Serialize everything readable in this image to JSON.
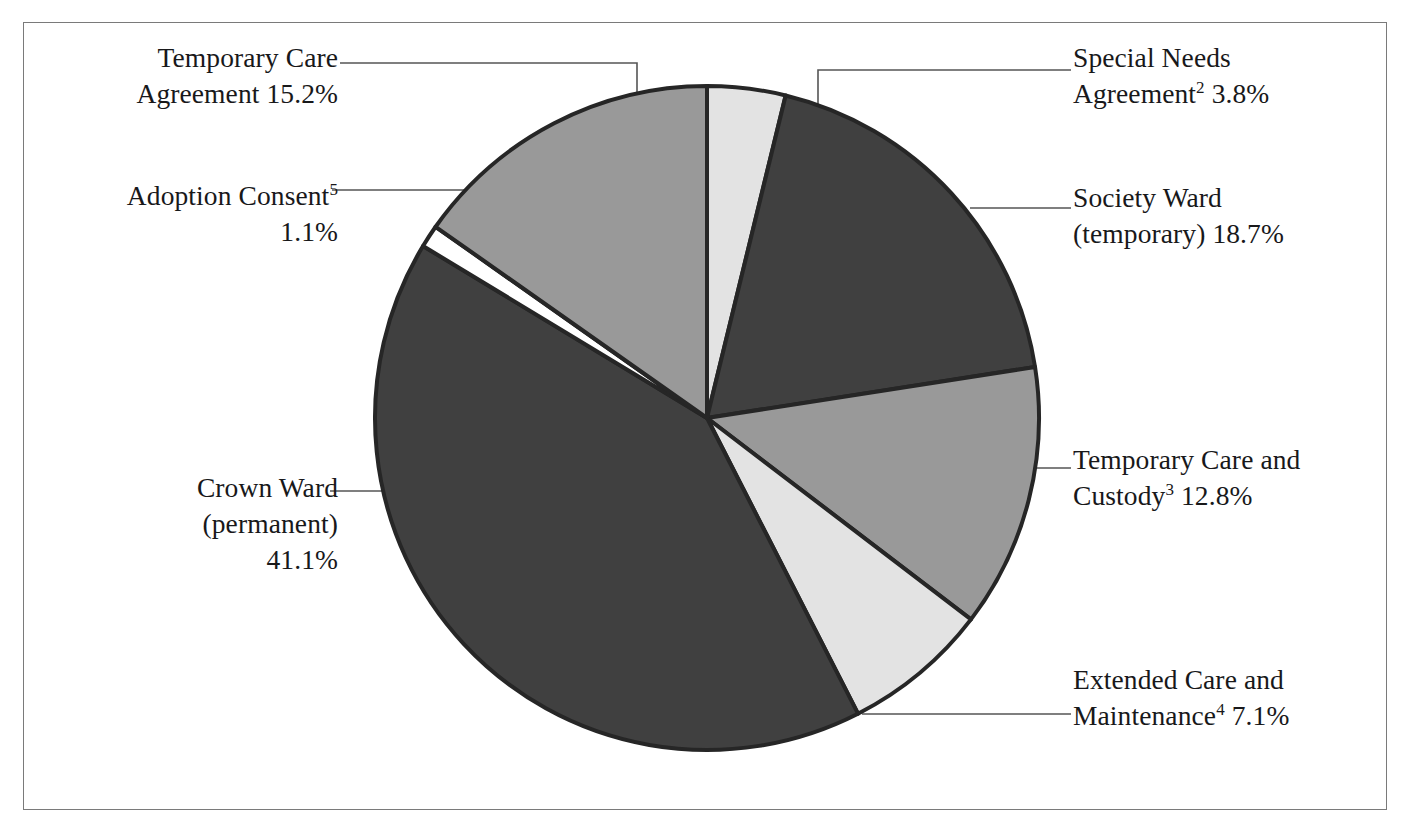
{
  "chart_data": {
    "type": "pie",
    "title": "",
    "subtitle": "",
    "xlabel": "",
    "ylabel": "",
    "legend_position": "callout-labels",
    "grid": false,
    "units": "percent",
    "total": 99.8,
    "start_angle_deg": 0,
    "direction": "clockwise",
    "categories": [
      "Special Needs Agreement2",
      "Society Ward (temporary)",
      "Temporary Care and Custody3",
      "Extended Care and Maintenance4",
      "Crown Ward (permanent)",
      "Adoption Consent5",
      "Temporary Care Agreement"
    ],
    "values": [
      3.8,
      18.7,
      12.8,
      7.1,
      41.1,
      1.1,
      15.2
    ],
    "slices": [
      {
        "key": "special-needs-agreement",
        "name": "Special Needs Agreement",
        "footnote": "2",
        "value": 3.8,
        "value_text": "3.8%",
        "color": "#e3e3e3",
        "label_lines": [
          "Special Needs",
          "Agreement2 3.8%"
        ]
      },
      {
        "key": "society-ward-temporary",
        "name": "Society Ward (temporary)",
        "footnote": "",
        "value": 18.7,
        "value_text": "18.7%",
        "color": "#404040",
        "label_lines": [
          "Society Ward",
          "(temporary) 18.7%"
        ]
      },
      {
        "key": "temporary-care-and-custody",
        "name": "Temporary Care and Custody",
        "footnote": "3",
        "value": 12.8,
        "value_text": "12.8%",
        "color": "#999999",
        "label_lines": [
          "Temporary Care and",
          "Custody3 12.8%"
        ]
      },
      {
        "key": "extended-care-and-maintenance",
        "name": "Extended Care and Maintenance",
        "footnote": "4",
        "value": 7.1,
        "value_text": "7.1%",
        "color": "#e3e3e3",
        "label_lines": [
          "Extended Care and",
          "Maintenance4 7.1%"
        ]
      },
      {
        "key": "crown-ward-permanent",
        "name": "Crown Ward (permanent)",
        "footnote": "",
        "value": 41.1,
        "value_text": "41.1%",
        "color": "#404040",
        "label_lines": [
          "Crown Ward",
          "(permanent)",
          "41.1%"
        ]
      },
      {
        "key": "adoption-consent",
        "name": "Adoption Consent",
        "footnote": "5",
        "value": 1.1,
        "value_text": "1.1%",
        "color": "#ffffff",
        "label_lines": [
          "Adoption Consent5",
          "1.1%"
        ]
      },
      {
        "key": "temporary-care-agreement",
        "name": "Temporary Care Agreement",
        "footnote": "",
        "value": 15.2,
        "value_text": "15.2%",
        "color": "#999999",
        "label_lines": [
          "Temporary Care",
          "Agreement 15.2%"
        ]
      }
    ]
  },
  "labels": {
    "temporary_care_agreement": {
      "line1": "Temporary Care",
      "line2_pre": "Agreement 15.2%"
    },
    "adoption_consent": {
      "line1_pre": "Adoption Consent",
      "line1_sup": "5",
      "line2": "1.1%"
    },
    "crown_ward": {
      "line1": "Crown Ward",
      "line2": "(permanent)",
      "line3": "41.1%"
    },
    "special_needs_agreement": {
      "line1": "Special Needs",
      "line2_pre": "Agreement",
      "line2_sup": "2",
      "line2_post": " 3.8%"
    },
    "society_ward": {
      "line1": "Society Ward",
      "line2": "(temporary) 18.7%"
    },
    "temporary_care_custody": {
      "line1": "Temporary Care and",
      "line2_pre": "Custody",
      "line2_sup": "3",
      "line2_post": " 12.8%"
    },
    "extended_care_maintenance": {
      "line1": "Extended Care and",
      "line2_pre": "Maintenance",
      "line2_sup": "4",
      "line2_post": " 7.1%"
    }
  },
  "style": {
    "slice_dark": "#404040",
    "slice_medium": "#999999",
    "slice_light": "#e3e3e3",
    "slice_white": "#ffffff",
    "slice_stroke": "#262626",
    "leader_line": "#555555",
    "frame_border": "#7a7a7a",
    "background": "#ffffff",
    "text": "#18181a"
  }
}
